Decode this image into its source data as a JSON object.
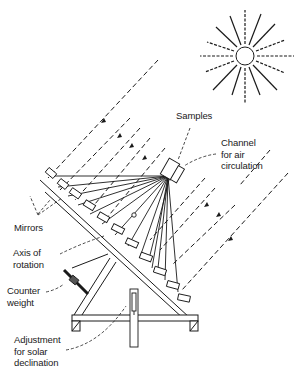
{
  "diagram": {
    "labels": {
      "samples": "Samples",
      "channel": [
        "Channel",
        "for  air",
        "circulation"
      ],
      "mirrors": "Mirrors",
      "axis": [
        "Axis  of",
        "rotation"
      ],
      "counterweight": [
        "Counter",
        "weight"
      ],
      "adjustment": [
        "Adjustment",
        "for  solar",
        "declination"
      ]
    },
    "icons": {
      "sun": "sun-icon"
    },
    "colors": {
      "ink": "#1a1a1a",
      "background": "#ffffff"
    }
  }
}
